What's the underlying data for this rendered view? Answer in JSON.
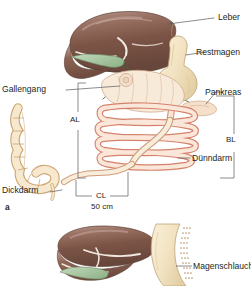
{
  "figure": {
    "background": "#ffffff",
    "panels": [
      {
        "letter": "a",
        "name": "roux-en-y-gastric-bypass"
      },
      {
        "letter": "",
        "name": "sleeve-gastrectomy"
      }
    ]
  },
  "labels": {
    "liver": "Leber",
    "gastric_pouch": "Restmagen",
    "pancreas": "Pankreas",
    "bile_duct": "Gallengang",
    "large_intestine": "Dickdarm",
    "small_intestine": "Dünndarm",
    "gastric_sleeve": "Magenschlauch"
  },
  "limbs": {
    "alimentary": "AL",
    "biliopancreatic": "BL",
    "common": "CL",
    "common_length": "50 cm"
  },
  "colors": {
    "liver_dark": "#6b4a3f",
    "liver_mid": "#8a6457",
    "liver_light": "#a98579",
    "liver_highlight": "#c9ada3",
    "gallbladder": "#a9c6a4",
    "bile_duct_line": "#2f6b43",
    "stomach_fill": "#f3e6c9",
    "stomach_edge": "#c8ab77",
    "intestine_fill": "#f6cdbc",
    "intestine_edge": "#d4826a",
    "colon_fill": "#f6e3c8",
    "colon_edge": "#cda772",
    "jejunum_fill": "#f7e9d2",
    "leader_line": "#5a5a5a",
    "text": "#231f20"
  }
}
